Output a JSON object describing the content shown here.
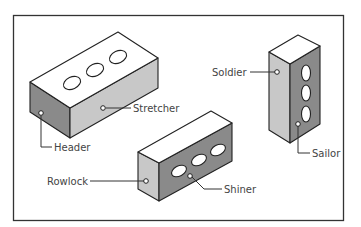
{
  "diagram": {
    "colors": {
      "background": "#ffffff",
      "frame": "#333333",
      "top_face": "#ffffff",
      "light_face": "#c8c8c8",
      "dark_face": "#8a8a8a",
      "outline": "#222222",
      "label": "#444444"
    },
    "labels": {
      "stretcher": "Stretcher",
      "header": "Header",
      "soldier": "Soldier",
      "sailor": "Sailor",
      "rowlock": "Rowlock",
      "shiner": "Shiner"
    },
    "bricks": [
      {
        "name": "horizontal-brick",
        "faces_labeled": [
          "Header",
          "Stretcher"
        ],
        "holes": 3
      },
      {
        "name": "vertical-brick",
        "faces_labeled": [
          "Soldier",
          "Sailor"
        ],
        "holes": 3
      },
      {
        "name": "on-edge-brick",
        "faces_labeled": [
          "Rowlock",
          "Shiner"
        ],
        "holes": 3
      }
    ]
  }
}
